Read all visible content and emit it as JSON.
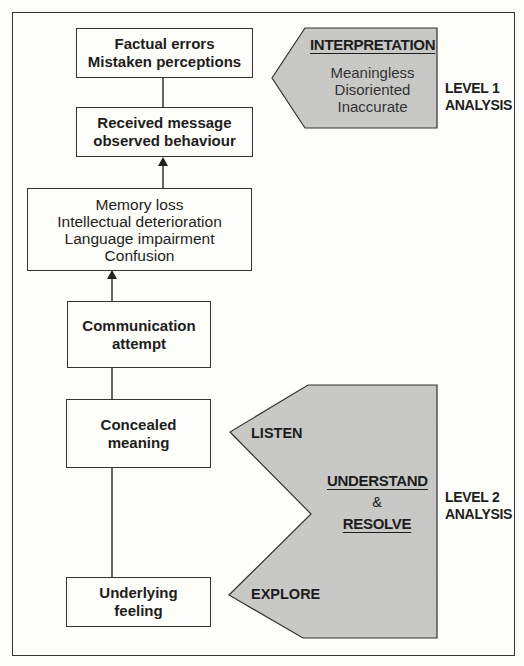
{
  "diagram": {
    "flow_boxes": [
      {
        "id": "factual-errors",
        "lines": [
          "Factual errors",
          "Mistaken perceptions"
        ],
        "style": "bold"
      },
      {
        "id": "received-message",
        "lines": [
          "Received message",
          "observed behaviour"
        ],
        "style": "bold"
      },
      {
        "id": "memory-loss",
        "lines": [
          "Memory loss",
          "Intellectual deterioration",
          "Language impairment",
          "Confusion"
        ],
        "style": "regular"
      },
      {
        "id": "communication-attempt",
        "lines": [
          "Communication",
          "attempt"
        ],
        "style": "bold"
      },
      {
        "id": "concealed-meaning",
        "lines": [
          "Concealed",
          "meaning"
        ],
        "style": "bold"
      },
      {
        "id": "underlying-feeling",
        "lines": [
          "Underlying",
          "feeling"
        ],
        "style": "bold"
      }
    ],
    "level1": {
      "heading": "INTERPRETATION",
      "items": [
        "Meaningless",
        "Disoriented",
        "Inaccurate"
      ],
      "label": [
        "LEVEL 1",
        "ANALYSIS"
      ]
    },
    "level2": {
      "listen": "LISTEN",
      "explore": "EXPLORE",
      "understand": "UNDERSTAND",
      "ampersand": "&",
      "resolve": "RESOLVE",
      "label": [
        "LEVEL 2",
        "ANALYSIS"
      ]
    },
    "colors": {
      "shape_fill": "#c8c8c6",
      "line": "#333333",
      "background": "#fdfdf9"
    }
  }
}
